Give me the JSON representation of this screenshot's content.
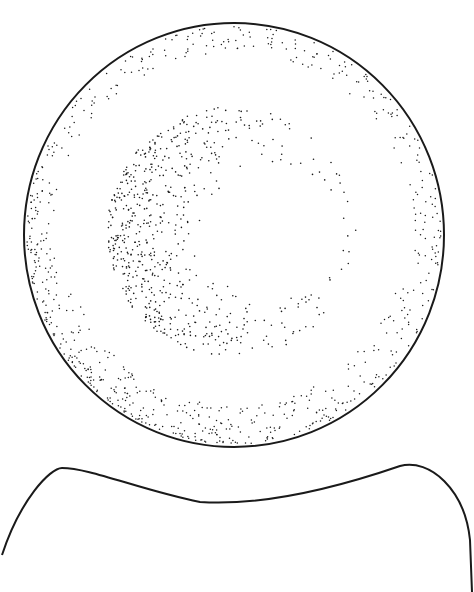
{
  "illustration": {
    "subject": "biconcave disc (red blood cell) stipple drawing",
    "background": "#ffffff",
    "ink": "#1a1a1a",
    "top_view": {
      "label": "",
      "cx": 234,
      "cy": 235,
      "rx": 210,
      "ry": 212,
      "stroke_width": 2,
      "rim_dots": 1400,
      "inner_ring": {
        "cx": 232,
        "cy": 232,
        "r_outer": 125,
        "r_inner": 68,
        "center_offset_x": 40,
        "center_offset_y": 0,
        "dots": 2200
      }
    },
    "side_view": {
      "label": "",
      "stroke_width": 2,
      "path": "M 2 555 C 20 500, 50 468, 62 468 C 90 468, 140 490, 200 502 C 260 506, 330 490, 400 466 C 430 458, 465 490, 470 540 L 472 592"
    }
  }
}
